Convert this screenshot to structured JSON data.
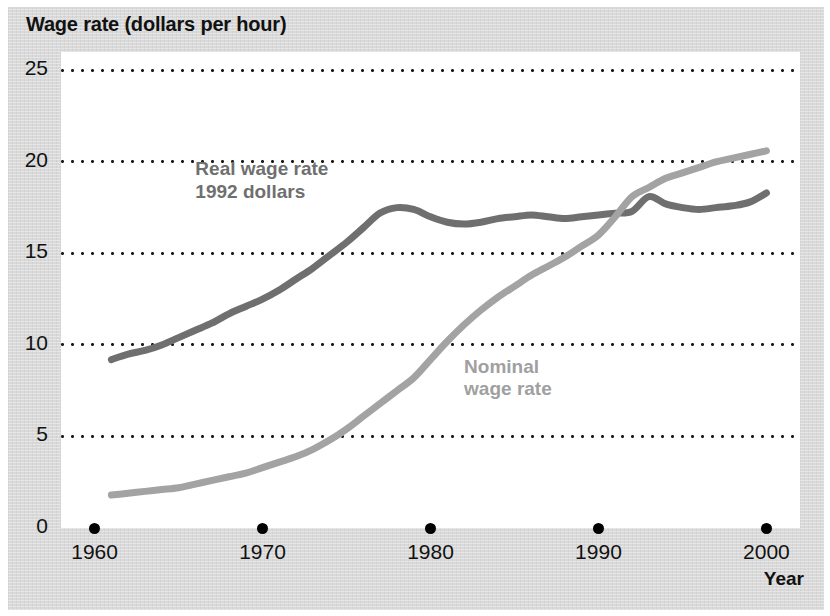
{
  "figure": {
    "title": "Wage rate (dollars per hour)",
    "x_axis_title": "Year",
    "background_color": "#d9d9d9",
    "plot_background_color": "#ffffff"
  },
  "chart_data": {
    "type": "line",
    "title": "Wage rate (dollars per hour)",
    "xlabel": "Year",
    "ylabel": "Wage rate (dollars per hour)",
    "xlim": [
      1958,
      2002
    ],
    "ylim": [
      0,
      26
    ],
    "xticks": [
      1960,
      1970,
      1980,
      1990,
      2000
    ],
    "xtick_labels": [
      "1960",
      "1970",
      "1980",
      "1990",
      "2000"
    ],
    "yticks": [
      0,
      5,
      10,
      15,
      20,
      25
    ],
    "ytick_labels": [
      "0",
      "5",
      "10",
      "15",
      "20",
      "25"
    ],
    "grid": "horizontal-dotted",
    "legend": "inline-annotations",
    "series": [
      {
        "name": "Real wage rate 1992 dollars",
        "label_lines": [
          "Real wage rate",
          "1992 dollars"
        ],
        "color": "#6f6f6f",
        "x": [
          1961,
          1962,
          1963,
          1964,
          1965,
          1966,
          1967,
          1968,
          1969,
          1970,
          1971,
          1972,
          1973,
          1974,
          1975,
          1976,
          1977,
          1978,
          1979,
          1980,
          1981,
          1982,
          1983,
          1984,
          1985,
          1986,
          1987,
          1988,
          1989,
          1990,
          1991,
          1992,
          1993,
          1994,
          1995,
          1996,
          1997,
          1998,
          1999,
          2000
        ],
        "values": [
          9.2,
          9.5,
          9.7,
          10.0,
          10.4,
          10.8,
          11.2,
          11.7,
          12.1,
          12.5,
          13.0,
          13.6,
          14.2,
          14.9,
          15.6,
          16.4,
          17.2,
          17.5,
          17.4,
          17.0,
          16.7,
          16.6,
          16.7,
          16.9,
          17.0,
          17.1,
          17.0,
          16.9,
          17.0,
          17.1,
          17.2,
          17.3,
          18.1,
          17.7,
          17.5,
          17.4,
          17.5,
          17.6,
          17.8,
          18.3
        ]
      },
      {
        "name": "Nominal wage rate",
        "label_lines": [
          "Nominal",
          "wage rate"
        ],
        "color": "#a3a3a3",
        "x": [
          1961,
          1962,
          1963,
          1964,
          1965,
          1966,
          1967,
          1968,
          1969,
          1970,
          1971,
          1972,
          1973,
          1974,
          1975,
          1976,
          1977,
          1978,
          1979,
          1980,
          1981,
          1982,
          1983,
          1984,
          1985,
          1986,
          1987,
          1988,
          1989,
          1990,
          1991,
          1992,
          1993,
          1994,
          1995,
          1996,
          1997,
          1998,
          1999,
          2000
        ],
        "values": [
          1.8,
          1.9,
          2.0,
          2.1,
          2.2,
          2.4,
          2.6,
          2.8,
          3.0,
          3.3,
          3.6,
          3.9,
          4.3,
          4.8,
          5.4,
          6.1,
          6.8,
          7.5,
          8.2,
          9.2,
          10.2,
          11.1,
          11.9,
          12.6,
          13.2,
          13.8,
          14.3,
          14.8,
          15.4,
          16.0,
          17.0,
          18.1,
          18.6,
          19.1,
          19.4,
          19.7,
          20.0,
          20.2,
          20.4,
          20.6
        ]
      }
    ],
    "annotations": [
      {
        "text": "Real wage rate 1992 dollars",
        "at_year": 1966,
        "at_value": 20.2,
        "color": "#6f6f6f"
      },
      {
        "text": "Nominal wage rate",
        "at_year": 1982,
        "at_value": 9.4,
        "color": "#a0a0a0"
      }
    ]
  }
}
